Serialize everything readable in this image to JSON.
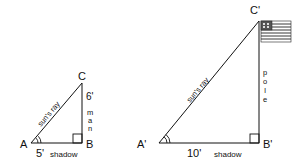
{
  "diagram": {
    "small_triangle": {
      "vertices": {
        "A": "A",
        "B": "B",
        "C": "C"
      },
      "hypotenuse_label": "sun's ray",
      "base_length": "5'",
      "base_label": "shadow",
      "height_length": "6'",
      "height_label": "man"
    },
    "large_triangle": {
      "vertices": {
        "A": "A'",
        "B": "B'",
        "C": "C'"
      },
      "hypotenuse_label": "sun's ray",
      "base_length": "10'",
      "base_label": "shadow",
      "height_label": "pole"
    },
    "colors": {
      "stroke": "#111111",
      "background": "#ffffff"
    }
  }
}
